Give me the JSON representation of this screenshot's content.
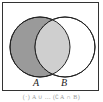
{
  "diagram": {
    "type": "venn",
    "sets": [
      {
        "label": "A",
        "fill": "#9a9a9a"
      },
      {
        "label": "B",
        "fill": "#ffffff"
      }
    ],
    "intersection_fill": "#cfcfcf",
    "shaded_region": "A",
    "caption": "(·) A ∪ ... (∁A ∩ B)"
  }
}
